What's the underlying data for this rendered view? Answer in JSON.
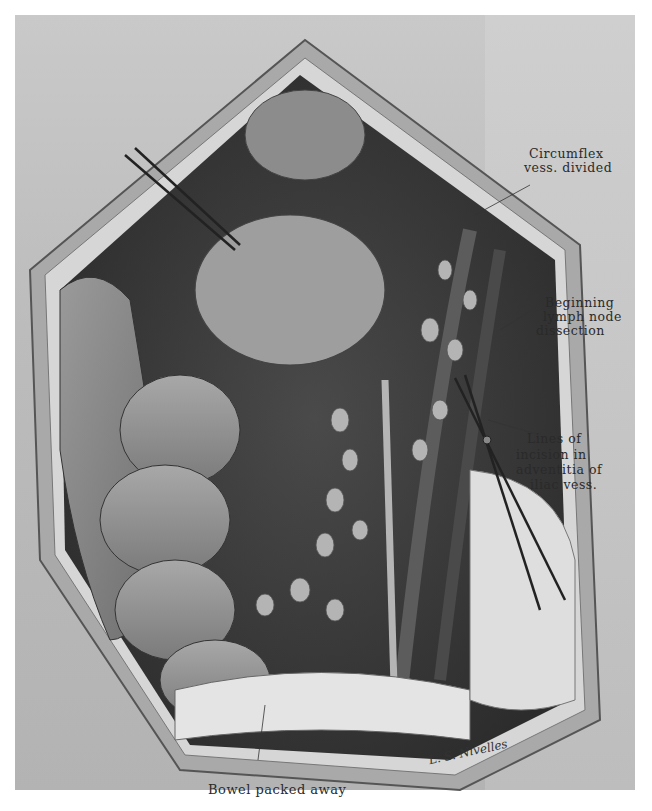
{
  "figure": {
    "type": "surgical-illustration",
    "colors": {
      "background": "#ffffff",
      "drape": "#c4c4c4",
      "cavity_dark": "#3a3a3a",
      "tissue_mid": "#8a8a8a",
      "label_text": "#2a2a2a"
    }
  },
  "labels": {
    "circumflex_line1": "Circumflex",
    "circumflex_line2": "vess. divided",
    "lymph_line1": "Beginning",
    "lymph_line2": "lymph node",
    "lymph_line3": "dissection",
    "incision_line1": "Lines of",
    "incision_line2": "incision in",
    "incision_line3": "adventitia of",
    "incision_line4": "iliac vess.",
    "bowel": "Bowel packed away"
  },
  "signature": "L. S. Nivelles"
}
